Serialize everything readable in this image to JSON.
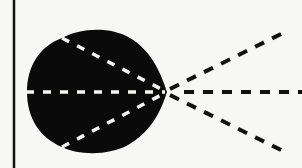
{
  "diagram": {
    "colors": {
      "background": "#f7f7f5",
      "shape": "#0a0a0a",
      "inner_dash": "#f5f5f0",
      "outer_dash": "#111111",
      "border_line": "#111111"
    },
    "border_line": {
      "x": 14,
      "y1": 0,
      "y2": 168
    },
    "focal_point": {
      "x": 167,
      "y": 92
    },
    "rays": [
      {
        "name": "upper-ray",
        "inner_start": [
          62,
          38
        ],
        "outer_end": [
          287,
          31
        ]
      },
      {
        "name": "middle-ray",
        "inner_start": [
          26,
          92
        ],
        "outer_end": [
          302,
          92
        ]
      },
      {
        "name": "lower-ray",
        "inner_start": [
          62,
          147
        ],
        "outer_end": [
          287,
          153
        ]
      }
    ]
  }
}
